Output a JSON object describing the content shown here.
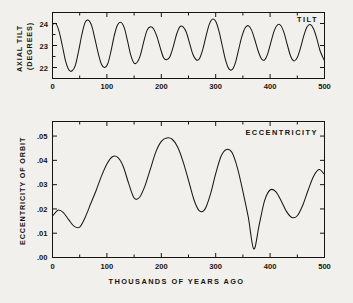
{
  "figure": {
    "background_color": "#f2f0ec",
    "ink_color": "#16150f",
    "xaxis_caption": "THOUSANDS OF YEARS AGO"
  },
  "chart_data": [
    {
      "type": "line",
      "title": "TILT",
      "xlabel": "THOUSANDS OF YEARS AGO",
      "ylabel": "AXIAL TILT (DEGREES)",
      "ylabel_lines": [
        "AXIAL TILT",
        "(DEGREES)"
      ],
      "xlim": [
        0,
        500
      ],
      "ylim": [
        21.6,
        24.6
      ],
      "xticks": [
        0,
        100,
        200,
        300,
        400,
        500
      ],
      "xtick_labels": [
        "0",
        "100",
        "200",
        "300",
        "400",
        "500"
      ],
      "xticks_minor": [
        50,
        150,
        250,
        350,
        450
      ],
      "yticks": [
        22,
        23,
        24
      ],
      "ytick_labels": [
        "22",
        "23",
        "24"
      ],
      "grid": false,
      "legend": "none",
      "title_position": "top-right",
      "x": [
        0,
        6,
        12,
        18,
        24,
        30,
        36,
        42,
        48,
        54,
        60,
        66,
        72,
        78,
        84,
        90,
        96,
        102,
        108,
        114,
        120,
        126,
        132,
        138,
        144,
        150,
        156,
        162,
        168,
        174,
        180,
        186,
        192,
        198,
        204,
        210,
        216,
        222,
        228,
        234,
        240,
        246,
        252,
        258,
        264,
        270,
        276,
        282,
        288,
        294,
        300,
        306,
        312,
        318,
        324,
        330,
        336,
        342,
        348,
        354,
        360,
        366,
        372,
        378,
        384,
        390,
        396,
        402,
        408,
        414,
        420,
        426,
        432,
        438,
        444,
        450,
        456,
        462,
        468,
        474,
        480,
        486,
        492,
        500
      ],
      "values": [
        24.05,
        24.1,
        23.75,
        23.1,
        22.4,
        22.0,
        21.95,
        22.2,
        22.85,
        23.6,
        24.15,
        24.25,
        24.0,
        23.4,
        22.75,
        22.25,
        22.1,
        22.3,
        22.9,
        23.6,
        24.05,
        24.15,
        23.9,
        23.3,
        22.65,
        22.3,
        22.35,
        22.7,
        23.3,
        23.8,
        23.95,
        23.85,
        23.5,
        23.0,
        22.55,
        22.45,
        22.6,
        23.05,
        23.6,
        23.95,
        23.95,
        23.7,
        23.2,
        22.7,
        22.45,
        22.5,
        22.9,
        23.5,
        24.05,
        24.3,
        24.2,
        23.75,
        23.1,
        22.45,
        22.05,
        22.0,
        22.3,
        22.9,
        23.5,
        23.9,
        24.0,
        23.8,
        23.35,
        22.85,
        22.5,
        22.45,
        22.75,
        23.3,
        23.8,
        24.05,
        24.0,
        23.65,
        23.1,
        22.6,
        22.4,
        22.55,
        23.0,
        23.55,
        23.95,
        24.05,
        23.85,
        23.4,
        22.85,
        22.4
      ]
    },
    {
      "type": "line",
      "title": "ECCENTRICITY",
      "xlabel": "THOUSANDS OF YEARS AGO",
      "ylabel": "ECCENTRICITY OF ORBIT",
      "xlim": [
        0,
        500
      ],
      "ylim": [
        0.0,
        0.056
      ],
      "xticks": [
        0,
        100,
        200,
        300,
        400,
        500
      ],
      "xtick_labels": [
        "0",
        "100",
        "200",
        "300",
        "400",
        "500"
      ],
      "xticks_minor": [
        50,
        150,
        250,
        350,
        450
      ],
      "yticks": [
        0.0,
        0.01,
        0.02,
        0.03,
        0.04,
        0.05
      ],
      "ytick_labels": [
        ".00",
        ".01",
        ".02",
        ".03",
        ".04",
        ".05"
      ],
      "grid": false,
      "legend": "none",
      "title_position": "top-right",
      "x": [
        0,
        10,
        20,
        30,
        40,
        50,
        60,
        70,
        80,
        90,
        100,
        110,
        120,
        130,
        140,
        150,
        160,
        170,
        180,
        190,
        200,
        210,
        220,
        230,
        240,
        250,
        260,
        270,
        280,
        290,
        300,
        310,
        320,
        330,
        340,
        350,
        360,
        370,
        380,
        390,
        400,
        410,
        420,
        430,
        440,
        450,
        460,
        470,
        480,
        490,
        500
      ],
      "values": [
        0.017,
        0.0195,
        0.0185,
        0.0155,
        0.0128,
        0.0125,
        0.0165,
        0.022,
        0.0275,
        0.0335,
        0.0385,
        0.0415,
        0.0412,
        0.0375,
        0.0305,
        0.0245,
        0.0248,
        0.0295,
        0.0365,
        0.0435,
        0.0478,
        0.0492,
        0.0487,
        0.0455,
        0.0395,
        0.0318,
        0.0238,
        0.0192,
        0.0198,
        0.0258,
        0.0345,
        0.0418,
        0.0445,
        0.0432,
        0.0368,
        0.0272,
        0.0165,
        0.0035,
        0.0135,
        0.0235,
        0.0278,
        0.0272,
        0.0235,
        0.019,
        0.0165,
        0.0172,
        0.0215,
        0.0278,
        0.0335,
        0.0362,
        0.0342
      ]
    }
  ]
}
